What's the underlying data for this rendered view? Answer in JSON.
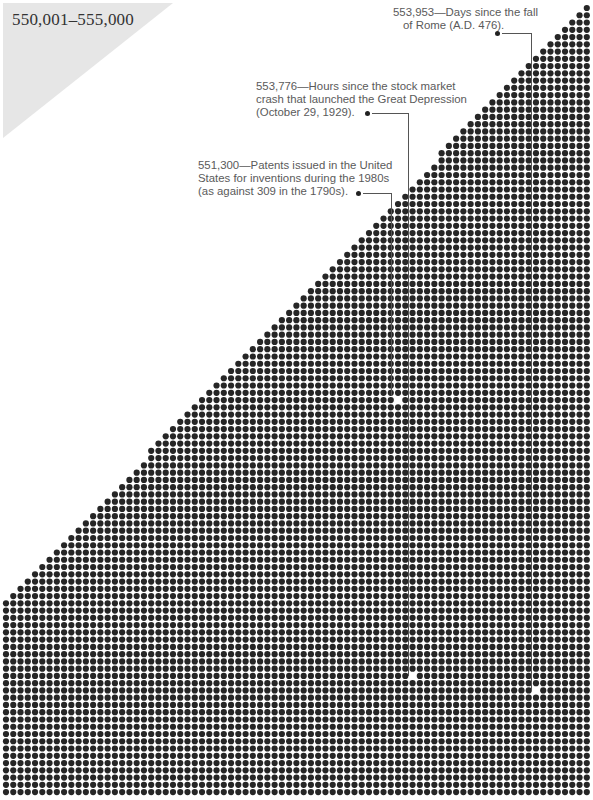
{
  "page": {
    "range_title": "550,001–555,000"
  },
  "annotations": [
    {
      "id": "days-rome",
      "number": "553,953",
      "lines": [
        "553,953—Days since the fall",
        "of Rome (A.D. 476)."
      ],
      "text": "Days since the fall of Rome (A.D. 476)."
    },
    {
      "id": "hours-crash",
      "number": "553,776",
      "lines": [
        "553,776—Hours since the stock market",
        "crash that launched the Great Depression",
        "(October 29, 1929)."
      ],
      "text": "Hours since the stock market crash that launched the Great Depression (October 29, 1929)."
    },
    {
      "id": "patents-1980s",
      "number": "551,300",
      "lines": [
        "551,300—Patents issued in the United",
        "States for inventions during the 1980s",
        "(as against 309 in the 1790s)."
      ],
      "text": "Patents issued in the United States for inventions during the 1980s (as against 309 in the 1790s)."
    }
  ],
  "colors": {
    "dot": "#262626",
    "highlight_dot": "#ffffff",
    "triangle": "#e6e6e6",
    "text": "#5a5a5a"
  },
  "chart_data": {
    "type": "dot-grid",
    "title": "550,001–555,000",
    "range_start": 550001,
    "range_end": 555000,
    "columns": 81,
    "rows": 109,
    "dot_total_shown": 5000,
    "fill": "triangular: grid filled from the top-right corner downward-left along a diagonal; bottom rows fully filled",
    "highlighted_values": [
      {
        "value": 551300,
        "label": "Patents issued in the United States for inventions during the 1980s (as against 309 in the 1790s)"
      },
      {
        "value": 553776,
        "label": "Hours since the stock market crash that launched the Great Depression (October 29, 1929)"
      },
      {
        "value": 553953,
        "label": "Days since the fall of Rome (A.D. 476)"
      }
    ]
  }
}
